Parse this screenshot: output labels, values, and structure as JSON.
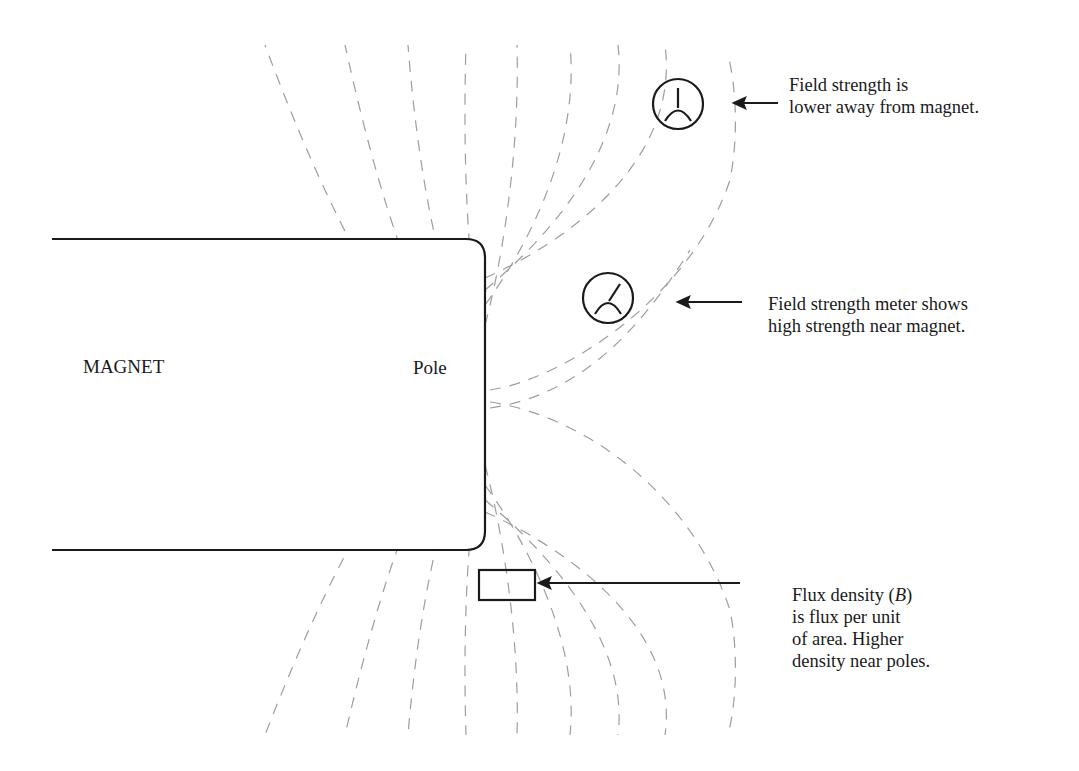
{
  "diagram": {
    "magnet_label": "MAGNET",
    "pole_label": "Pole",
    "callouts": [
      {
        "id": "field-strength-far",
        "lines": [
          "Field strength is",
          "lower away from magnet."
        ],
        "points_to": "field-strength-meter-far"
      },
      {
        "id": "field-strength-near",
        "lines": [
          "Field strength meter shows",
          "high strength near magnet."
        ],
        "points_to": "field-strength-meter-near"
      },
      {
        "id": "flux-density",
        "lines": [
          "Flux density (B)",
          "is flux per unit",
          "of area. Higher",
          "density near poles."
        ],
        "symbol": "B",
        "points_to": "flux-area-box"
      }
    ],
    "elements": {
      "magnet": "rounded-rectangle bar magnet (left side, cut off at left edge)",
      "field_lines": "dashed gray arcs emanating from pole",
      "meters": [
        "field-strength-meter-far",
        "field-strength-meter-near"
      ],
      "area_box": "flux-area-box"
    },
    "colors": {
      "stroke": "#1a1a1a",
      "field_line": "#9a9a9a",
      "background": "#ffffff"
    }
  }
}
